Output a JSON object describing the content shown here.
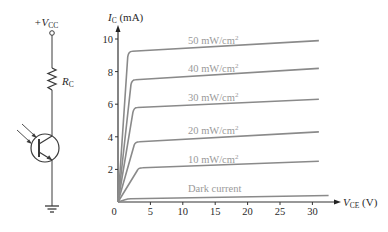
{
  "circuit": {
    "supply_label": "+V",
    "supply_sub": "CC",
    "resistor_label": "R",
    "resistor_sub": "C",
    "components": [
      "supply-terminal",
      "resistor",
      "phototransistor",
      "ground"
    ]
  },
  "chart_data": {
    "type": "line",
    "title": "",
    "xlabel": "V",
    "xlabel_sub": "CE",
    "xlabel_unit": " (V)",
    "ylabel": "I",
    "ylabel_sub": "C",
    "ylabel_unit": " (mA)",
    "xlim": [
      0,
      33
    ],
    "ylim": [
      0,
      10.8
    ],
    "xticks": [
      0,
      5,
      10,
      15,
      20,
      25,
      30
    ],
    "xtick_labels": [
      "0",
      "5",
      "10",
      "15",
      "20",
      "25",
      "30"
    ],
    "yticks": [
      2,
      4,
      6,
      8,
      10
    ],
    "ytick_labels": [
      "2",
      "4",
      "6",
      "8",
      "10"
    ],
    "grid": false,
    "legend": "inline labels above each curve",
    "series": [
      {
        "name": "50 mW/cm",
        "sup": "2",
        "x": [
          0,
          1.5,
          2.2,
          31
        ],
        "y": [
          0,
          8.9,
          9.25,
          9.9
        ]
      },
      {
        "name": "40 mW/cm",
        "sup": "2",
        "x": [
          0,
          2.0,
          2.7,
          31
        ],
        "y": [
          0,
          7.2,
          7.5,
          8.2
        ]
      },
      {
        "name": "30 mW/cm",
        "sup": "2",
        "x": [
          0,
          2.3,
          3.0,
          31
        ],
        "y": [
          0,
          5.5,
          5.8,
          6.3
        ]
      },
      {
        "name": "20 mW/cm",
        "sup": "2",
        "x": [
          0,
          2.5,
          3.3,
          31
        ],
        "y": [
          0,
          3.5,
          3.7,
          4.3
        ]
      },
      {
        "name": "10 mW/cm",
        "sup": "2",
        "x": [
          0,
          3.0,
          3.8,
          31
        ],
        "y": [
          0,
          1.95,
          2.1,
          2.5
        ]
      },
      {
        "name": "Dark current",
        "sup": "",
        "x": [
          0,
          1.2,
          2.0,
          32.5
        ],
        "y": [
          0,
          0.15,
          0.2,
          0.4
        ]
      }
    ]
  }
}
